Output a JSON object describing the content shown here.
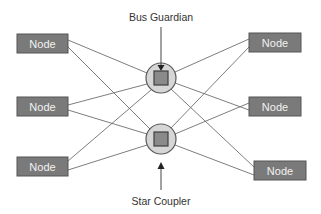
{
  "diagram": {
    "type": "star-network",
    "labels": {
      "top": "Bus Guardian",
      "bottom": "Star Coupler"
    },
    "colors": {
      "node_fill": "#7a7a7a",
      "node_text": "#f2f2f2",
      "hub_fill": "#d6d6d6",
      "hub_inner": "#8a8a8a",
      "edge": "#6e6e6e"
    },
    "hubs": [
      {
        "id": "hub-top",
        "role": "Bus Guardian",
        "cx": 161,
        "cy": 78,
        "r": 15
      },
      {
        "id": "hub-bottom",
        "role": "Star Coupler",
        "cx": 161,
        "cy": 139,
        "r": 15
      }
    ],
    "nodes": [
      {
        "id": "left-top",
        "label": "Node",
        "x": 17,
        "y": 34,
        "w": 51,
        "h": 19
      },
      {
        "id": "left-middle",
        "label": "Node",
        "x": 17,
        "y": 97,
        "w": 51,
        "h": 19
      },
      {
        "id": "left-bottom",
        "label": "Node",
        "x": 17,
        "y": 157,
        "w": 51,
        "h": 19
      },
      {
        "id": "right-top",
        "label": "Node",
        "x": 249,
        "y": 33,
        "w": 52,
        "h": 19
      },
      {
        "id": "right-middle",
        "label": "Node",
        "x": 249,
        "y": 97,
        "w": 52,
        "h": 19
      },
      {
        "id": "right-bottom",
        "label": "Node",
        "x": 254,
        "y": 161,
        "w": 52,
        "h": 19
      }
    ],
    "edges_note": "Each node connects to both hubs"
  }
}
